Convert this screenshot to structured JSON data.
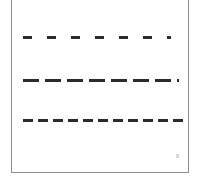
{
  "figure": {
    "title": "Dash pattern sample lines",
    "width": 201,
    "height": 179,
    "background_color": "#ffffff",
    "frame": {
      "visible": true,
      "color": "#8d8d8d",
      "line_width": 1,
      "left": 11,
      "right": 189,
      "bottom": 172,
      "top_cropped": true
    },
    "artifact": {
      "name": "scan-speck",
      "color": "#cfcfcf",
      "x": 176,
      "y": 154
    }
  },
  "chart_data": {
    "type": "line",
    "title": "Dash pattern sample lines",
    "subtitle": "",
    "xlabel": "",
    "ylabel": "",
    "grid": false,
    "legend_position": "none",
    "axis_visible": false,
    "tick_labels": [],
    "annotations": [],
    "series": [
      {
        "name": "long-dash-wide-gap",
        "label": "Line 1",
        "y": 38,
        "x_start": 23,
        "x_end": 171,
        "color": "#2b2b2b",
        "line_width": 3,
        "dash_length": 9,
        "gap_length": 15,
        "dash_count": 7,
        "values": [
          38,
          38,
          38,
          38,
          38,
          38,
          38
        ]
      },
      {
        "name": "long-dash-narrow-gap",
        "label": "Line 2",
        "y": 81,
        "x_start": 23,
        "x_end": 179,
        "color": "#2b2b2b",
        "line_width": 3,
        "dash_length": 16,
        "gap_length": 6,
        "dash_count": 7,
        "values": [
          81,
          81,
          81,
          81,
          81,
          81,
          81
        ]
      },
      {
        "name": "short-dash-tight-gap",
        "label": "Line 3",
        "y": 121,
        "x_start": 23,
        "x_end": 183,
        "color": "#2b2b2b",
        "line_width": 3,
        "dash_length": 10,
        "gap_length": 5,
        "dash_count": 11,
        "values": [
          121,
          121,
          121,
          121,
          121,
          121,
          121,
          121,
          121,
          121,
          121
        ]
      }
    ],
    "xlim": [
      11,
      189
    ],
    "ylim": [
      0,
      179
    ]
  }
}
